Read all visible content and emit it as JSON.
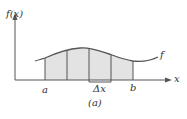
{
  "diagram": {
    "y_axis_label": "f(x)",
    "x_axis_label": "x",
    "curve_label": "f",
    "left_bound_label": "a",
    "right_bound_label": "b",
    "subinterval_label": "Δx",
    "caption": "(a)",
    "shade_color": "#e3e3e3",
    "line_color": "#555555",
    "partition_count": 4
  }
}
